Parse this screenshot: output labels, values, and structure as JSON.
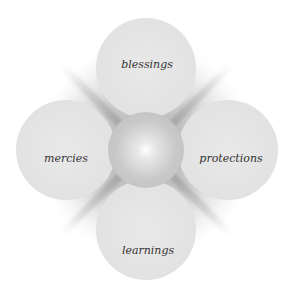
{
  "diagram": {
    "type": "four-petal flower",
    "center": {
      "label": ""
    },
    "petals": [
      {
        "position": "top",
        "label": "blessings"
      },
      {
        "position": "left",
        "label": "mercies"
      },
      {
        "position": "right",
        "label": "protections"
      },
      {
        "position": "bottom",
        "label": "learnings"
      }
    ]
  },
  "colors": {
    "background": "#ffffff",
    "petal": "#e4e4e4",
    "center": "#c4c4c4",
    "text": "#333333"
  }
}
